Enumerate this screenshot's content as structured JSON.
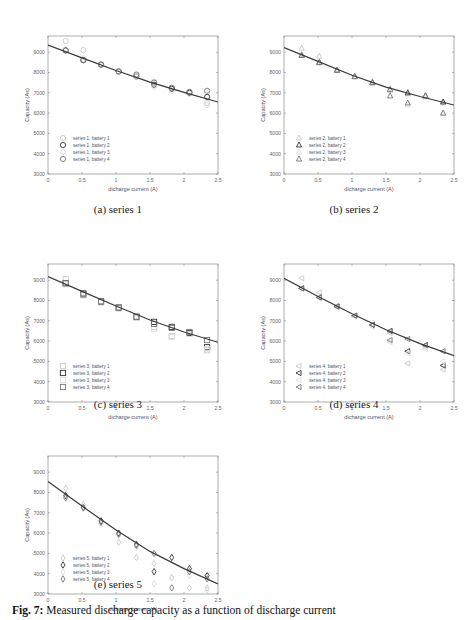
{
  "figure": {
    "caption_label": "Fig. 7:",
    "caption_text": "Measured discharge capacity as a function of discharge current"
  },
  "chart_data": [
    {
      "type": "scatter",
      "panel": "a",
      "subcaption": "(a) series 1",
      "xlabel": "dicharge current (A)",
      "ylabel": "Capacity (As)",
      "xlim": [
        0,
        2.5
      ],
      "ylim": [
        3000,
        9800
      ],
      "xticks": [
        0,
        0.5,
        1,
        1.5,
        2,
        2.5
      ],
      "xtick_labels": [
        "0",
        "0.5",
        "1",
        "1.5",
        "2",
        "2.5"
      ],
      "yticks": [
        3000,
        4000,
        5000,
        6000,
        7000,
        8000,
        9000
      ],
      "ytick_labels": [
        "3000",
        "4000",
        "5000",
        "6000",
        "7000",
        "8000",
        "9000"
      ],
      "marker": "circle",
      "legend_position": "lower left",
      "series": [
        {
          "name": "series 1, battery 1",
          "shade": "#c8c8c8",
          "x": [
            0.26,
            0.52,
            0.78,
            1.04,
            1.3,
            1.56,
            1.82,
            2.08,
            2.34
          ],
          "y": [
            9550,
            9100,
            8400,
            8050,
            7850,
            7550,
            7250,
            7000,
            6500
          ]
        },
        {
          "name": "series 1, battery 2",
          "shade": "#333333",
          "x": [
            0.26,
            0.52,
            0.78,
            1.04,
            1.3,
            1.56,
            1.82,
            2.08,
            2.34
          ],
          "y": [
            9100,
            8620,
            8380,
            8050,
            7800,
            7400,
            7200,
            7000,
            6800
          ]
        },
        {
          "name": "series 1, battery 3",
          "shade": "#dddddd",
          "x": [
            0.26,
            0.52,
            0.78,
            1.04,
            1.3,
            1.56,
            1.82,
            2.08,
            2.34
          ],
          "y": [
            9150,
            8700,
            8350,
            8050,
            7800,
            7300,
            7100,
            6950,
            6400
          ]
        },
        {
          "name": "series 1, battery 4",
          "shade": "#777777",
          "x": [
            0.26,
            0.52,
            0.78,
            1.04,
            1.3,
            1.56,
            1.82,
            2.08,
            2.34
          ],
          "y": [
            9080,
            8600,
            8400,
            8050,
            7900,
            7500,
            7250,
            7050,
            7100
          ]
        }
      ],
      "fit": {
        "x": [
          0,
          0.5,
          1,
          1.5,
          2,
          2.5
        ],
        "y": [
          9350,
          8720,
          8100,
          7530,
          7020,
          6550
        ]
      }
    },
    {
      "type": "scatter",
      "panel": "b",
      "subcaption": "(b) series 2",
      "xlabel": "dicharge current (A)",
      "ylabel": "Capacity (As)",
      "xlim": [
        0,
        2.5
      ],
      "ylim": [
        3000,
        9800
      ],
      "xticks": [
        0,
        0.5,
        1,
        1.5,
        2,
        2.5
      ],
      "xtick_labels": [
        "0",
        "0.5",
        "1",
        "1.5",
        "2",
        "2.5"
      ],
      "yticks": [
        3000,
        4000,
        5000,
        6000,
        7000,
        8000,
        9000
      ],
      "ytick_labels": [
        "3000",
        "4000",
        "5000",
        "6000",
        "7000",
        "8000",
        "9000"
      ],
      "marker": "triangle",
      "legend_position": "lower left",
      "series": [
        {
          "name": "series 2, battery 1",
          "shade": "#c8c8c8",
          "x": [
            0.26,
            0.52,
            0.78,
            1.04,
            1.3,
            1.56,
            1.82,
            2.08,
            2.34
          ],
          "y": [
            9200,
            8800,
            8100,
            7800,
            7550,
            7200,
            6950,
            6850,
            6500
          ]
        },
        {
          "name": "series 2, battery 2",
          "shade": "#333333",
          "x": [
            0.26,
            0.52,
            0.78,
            1.04,
            1.3,
            1.56,
            1.82,
            2.08,
            2.34
          ],
          "y": [
            8850,
            8500,
            8120,
            7800,
            7500,
            7150,
            7000,
            6850,
            6550
          ]
        },
        {
          "name": "series 2, battery 3",
          "shade": "#dddddd",
          "x": [
            0.26,
            0.52,
            0.78,
            1.04,
            1.3,
            1.56,
            1.82,
            2.08,
            2.34
          ],
          "y": [
            8900,
            8450,
            8100,
            7800,
            7500,
            7100,
            6400,
            6800,
            6000
          ]
        },
        {
          "name": "series 2, battery 4",
          "shade": "#777777",
          "x": [
            0.26,
            0.52,
            0.78,
            1.04,
            1.3,
            1.56,
            1.82,
            2.08,
            2.34
          ],
          "y": [
            8850,
            8500,
            8100,
            7800,
            7500,
            6850,
            6500,
            6850,
            6000
          ]
        }
      ],
      "fit": {
        "x": [
          0,
          0.5,
          1,
          1.5,
          2,
          2.5
        ],
        "y": [
          9230,
          8550,
          7870,
          7280,
          6820,
          6400
        ]
      }
    },
    {
      "type": "scatter",
      "panel": "c",
      "subcaption": "(c) series 3",
      "xlabel": "dicharge current (A)",
      "ylabel": "Capacity (As)",
      "xlim": [
        0,
        2.5
      ],
      "ylim": [
        3000,
        9800
      ],
      "xticks": [
        0,
        0.5,
        1,
        1.5,
        2,
        2.5
      ],
      "xtick_labels": [
        "0",
        "0.5",
        "1",
        "1.5",
        "2",
        "2.5"
      ],
      "yticks": [
        3000,
        4000,
        5000,
        6000,
        7000,
        8000,
        9000
      ],
      "ytick_labels": [
        "3000",
        "4000",
        "5000",
        "6000",
        "7000",
        "8000",
        "9000"
      ],
      "marker": "square",
      "legend_position": "lower left",
      "series": [
        {
          "name": "series 3, battery 1",
          "shade": "#c8c8c8",
          "x": [
            0.26,
            0.52,
            0.78,
            1.04,
            1.3,
            1.56,
            1.82,
            2.08,
            2.34
          ],
          "y": [
            9050,
            8300,
            7950,
            7650,
            7150,
            6700,
            6250,
            6400,
            5550
          ]
        },
        {
          "name": "series 3, battery 2",
          "shade": "#333333",
          "x": [
            0.26,
            0.52,
            0.78,
            1.04,
            1.3,
            1.56,
            1.82,
            2.08,
            2.34
          ],
          "y": [
            8850,
            8350,
            7950,
            7650,
            7200,
            6950,
            6700,
            6400,
            5700
          ]
        },
        {
          "name": "series 3, battery 3",
          "shade": "#dddddd",
          "x": [
            0.26,
            0.52,
            0.78,
            1.04,
            1.3,
            1.56,
            1.82,
            2.08,
            2.34
          ],
          "y": [
            8800,
            8250,
            7900,
            7600,
            7150,
            6600,
            6200,
            6350,
            5600
          ]
        },
        {
          "name": "series 3, battery 4",
          "shade": "#777777",
          "x": [
            0.26,
            0.52,
            0.78,
            1.04,
            1.3,
            1.56,
            1.82,
            2.08,
            2.34
          ],
          "y": [
            8850,
            8300,
            7950,
            7650,
            7200,
            6850,
            6650,
            6450,
            6050
          ]
        }
      ],
      "fit": {
        "x": [
          0,
          0.5,
          1,
          1.5,
          2,
          2.5
        ],
        "y": [
          9180,
          8450,
          7730,
          7040,
          6450,
          5940
        ]
      }
    },
    {
      "type": "scatter",
      "panel": "d",
      "subcaption": "(d) series 4",
      "xlabel": "dicharge current (A)",
      "ylabel": "Capacity (As)",
      "xlim": [
        0,
        2.5
      ],
      "ylim": [
        3000,
        9800
      ],
      "xticks": [
        0,
        0.5,
        1,
        1.5,
        2,
        2.5
      ],
      "xtick_labels": [
        "0",
        "0.5",
        "1",
        "1.5",
        "2",
        "2.5"
      ],
      "yticks": [
        3000,
        4000,
        5000,
        6000,
        7000,
        8000,
        9000
      ],
      "ytick_labels": [
        "3000",
        "4000",
        "5000",
        "6000",
        "7000",
        "8000",
        "9000"
      ],
      "marker": "left-triangle",
      "legend_position": "lower left",
      "series": [
        {
          "name": "series 4, battery 1",
          "shade": "#c8c8c8",
          "x": [
            0.26,
            0.52,
            0.78,
            1.04,
            1.3,
            1.56,
            1.82,
            2.08,
            2.34
          ],
          "y": [
            9100,
            8400,
            7750,
            7250,
            6800,
            6400,
            4900,
            5700,
            4600
          ]
        },
        {
          "name": "series 4, battery 2",
          "shade": "#333333",
          "x": [
            0.26,
            0.52,
            0.78,
            1.04,
            1.3,
            1.56,
            1.82,
            2.08,
            2.34
          ],
          "y": [
            8600,
            8150,
            7700,
            7250,
            6800,
            6500,
            5500,
            5800,
            4800
          ]
        },
        {
          "name": "series 4, battery 3",
          "shade": "#dddddd",
          "x": [
            0.26,
            0.52,
            0.78,
            1.04,
            1.3,
            1.56,
            1.82,
            2.08,
            2.34
          ],
          "y": [
            8550,
            8100,
            7650,
            7200,
            6700,
            5950,
            5400,
            5600,
            5000
          ]
        },
        {
          "name": "series 4, battery 4",
          "shade": "#777777",
          "x": [
            0.26,
            0.52,
            0.78,
            1.04,
            1.3,
            1.56,
            1.82,
            2.08,
            2.34
          ],
          "y": [
            8600,
            8150,
            7700,
            7250,
            6800,
            6050,
            6100,
            5800,
            5500
          ]
        }
      ],
      "fit": {
        "x": [
          0,
          0.5,
          1,
          1.5,
          2,
          2.5
        ],
        "y": [
          9100,
          8200,
          7350,
          6560,
          5880,
          5280
        ]
      }
    },
    {
      "type": "scatter",
      "panel": "e",
      "subcaption": "(e) series 5",
      "xlabel": "dicharge current (A)",
      "ylabel": "Capacity (As)",
      "xlim": [
        0,
        2.5
      ],
      "ylim": [
        3000,
        9800
      ],
      "xticks": [
        0,
        0.5,
        1,
        1.5,
        2,
        2.5
      ],
      "xtick_labels": [
        "0",
        "0.5",
        "1",
        "1.5",
        "2",
        "2.5"
      ],
      "yticks": [
        3000,
        4000,
        5000,
        6000,
        7000,
        8000,
        9000
      ],
      "ytick_labels": [
        "3000",
        "4000",
        "5000",
        "6000",
        "7000",
        "8000",
        "9000"
      ],
      "marker": "diamond",
      "legend_position": "lower left",
      "series": [
        {
          "name": "series 5, battery 1",
          "shade": "#c8c8c8",
          "x": [
            0.26,
            0.52,
            0.78,
            1.04,
            1.3,
            1.56,
            1.82,
            2.08,
            2.34
          ],
          "y": [
            8200,
            7400,
            6500,
            5550,
            4800,
            4500,
            3800,
            3300,
            3300
          ]
        },
        {
          "name": "series 5, battery 2",
          "shade": "#333333",
          "x": [
            0.26,
            0.52,
            0.78,
            1.04,
            1.3,
            1.56,
            1.82,
            2.08,
            2.34
          ],
          "y": [
            7850,
            7250,
            6600,
            6000,
            5450,
            4100,
            4800,
            4250,
            3900
          ]
        },
        {
          "name": "series 5, battery 3",
          "shade": "#dddddd",
          "x": [
            0.26,
            0.52,
            0.78,
            1.04,
            1.3,
            1.56,
            1.82,
            2.08,
            2.34
          ],
          "y": [
            7700,
            7200,
            6450,
            5900,
            5300,
            3500,
            3800,
            3900,
            3200
          ]
        },
        {
          "name": "series 5, battery 4",
          "shade": "#777777",
          "x": [
            0.26,
            0.52,
            0.78,
            1.04,
            1.3,
            1.56,
            1.82,
            2.08,
            2.34
          ],
          "y": [
            7750,
            7250,
            6550,
            5950,
            5400,
            5000,
            3300,
            4100,
            3750
          ]
        }
      ],
      "fit": {
        "x": [
          0,
          0.5,
          1,
          1.5,
          2,
          2.5
        ],
        "y": [
          8550,
          7330,
          6150,
          5100,
          4250,
          3500
        ]
      }
    }
  ]
}
